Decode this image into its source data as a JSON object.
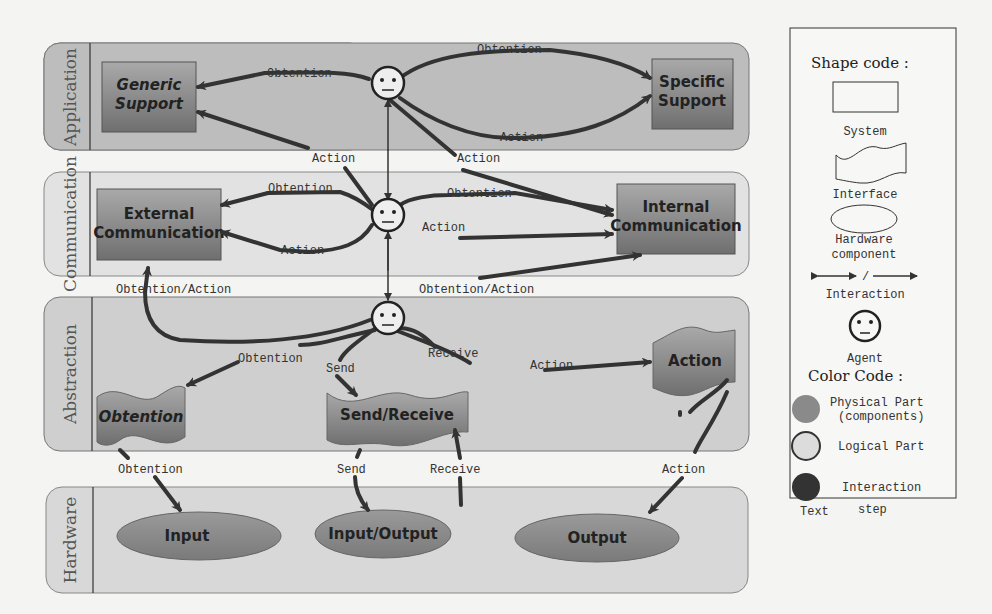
{
  "lanes": [
    {
      "title": "Application"
    },
    {
      "title": "Communication"
    },
    {
      "title": "Abstraction"
    },
    {
      "title": "Hardware"
    }
  ],
  "nodes": {
    "generic_support": "Generic Support",
    "generic_support_l1": "Generic",
    "generic_support_l2": "Support",
    "specific_support_l1": "Specific",
    "specific_support_l2": "Support",
    "external_comm_l1": "External",
    "external_comm_l2": "Communication",
    "internal_comm_l1": "Internal",
    "internal_comm_l2": "Communication",
    "obtention_interface": "Obtention",
    "send_receive_interface": "Send/Receive",
    "action_interface": "Action",
    "input": "Input",
    "input_output": "Input/Output",
    "output": "Output"
  },
  "edges": {
    "obtention": "Obtention",
    "action": "Action",
    "obtention_action": "Obtention/Action",
    "send": "Send",
    "receive": "Receive"
  },
  "legend": {
    "shape_code": "Shape code :",
    "system": "System",
    "interface": "Interface",
    "hardware_l1": "Hardware",
    "hardware_l2": "component",
    "interaction_sep": "/",
    "interaction": "Interaction",
    "agent": "Agent",
    "color_code": "Color Code :",
    "physical_l1": "Physical Part",
    "physical_l2": "(components)",
    "logical": "Logical Part",
    "interaction_color": "Interaction",
    "text": "Text",
    "step": "step"
  },
  "colors": {
    "physical": "#8a8a8a",
    "logical": "#dcdcdc",
    "interaction": "#333333",
    "lane_dark": "#bdbdbd",
    "lane_light": "#e2e2e2"
  }
}
